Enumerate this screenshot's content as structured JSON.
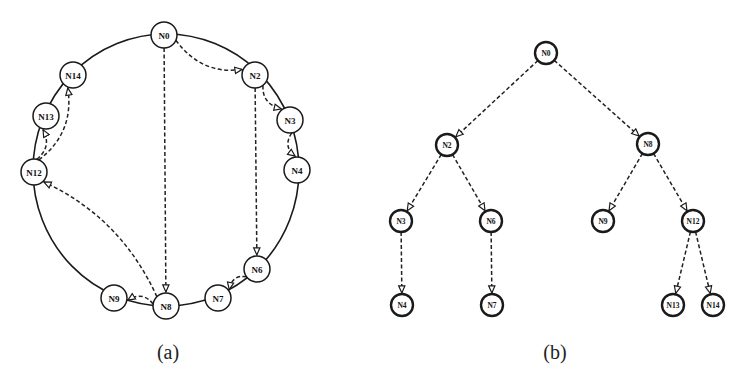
{
  "figure_a": {
    "caption": "(a)",
    "ring": {
      "cx": 166,
      "cy": 170,
      "rx": 133,
      "ry": 136
    },
    "node_radius": 13,
    "nodes": [
      {
        "id": "N0",
        "label": "N0",
        "x": 164,
        "y": 35
      },
      {
        "id": "N2",
        "label": "N2",
        "x": 255,
        "y": 75
      },
      {
        "id": "N3",
        "label": "N3",
        "x": 290,
        "y": 120
      },
      {
        "id": "N4",
        "label": "N4",
        "x": 297,
        "y": 170
      },
      {
        "id": "N6",
        "label": "N6",
        "x": 257,
        "y": 269
      },
      {
        "id": "N7",
        "label": "N7",
        "x": 218,
        "y": 298
      },
      {
        "id": "N8",
        "label": "N8",
        "x": 166,
        "y": 306
      },
      {
        "id": "N9",
        "label": "N9",
        "x": 114,
        "y": 298
      },
      {
        "id": "N12",
        "label": "N12",
        "x": 34,
        "y": 172
      },
      {
        "id": "N13",
        "label": "N13",
        "x": 46,
        "y": 116
      },
      {
        "id": "N14",
        "label": "N14",
        "x": 73,
        "y": 75
      }
    ],
    "edges": [
      {
        "from": "N0",
        "to": "N2"
      },
      {
        "from": "N0",
        "to": "N8"
      },
      {
        "from": "N2",
        "to": "N3"
      },
      {
        "from": "N2",
        "to": "N6"
      },
      {
        "from": "N3",
        "to": "N4"
      },
      {
        "from": "N6",
        "to": "N7"
      },
      {
        "from": "N8",
        "to": "N9"
      },
      {
        "from": "N8",
        "to": "N12"
      },
      {
        "from": "N12",
        "to": "N13"
      },
      {
        "from": "N12",
        "to": "N14"
      }
    ]
  },
  "figure_b": {
    "caption": "(b)",
    "node_radius": 11,
    "nodes": [
      {
        "id": "N0",
        "label": "N0",
        "x": 546,
        "y": 53
      },
      {
        "id": "N2",
        "label": "N2",
        "x": 447,
        "y": 145
      },
      {
        "id": "N8",
        "label": "N8",
        "x": 648,
        "y": 144
      },
      {
        "id": "N3",
        "label": "N3",
        "x": 401,
        "y": 221
      },
      {
        "id": "N6",
        "label": "N6",
        "x": 491,
        "y": 221
      },
      {
        "id": "N9",
        "label": "N9",
        "x": 603,
        "y": 221
      },
      {
        "id": "N12",
        "label": "N12",
        "x": 693,
        "y": 221
      },
      {
        "id": "N4",
        "label": "N4",
        "x": 402,
        "y": 305
      },
      {
        "id": "N7",
        "label": "N7",
        "x": 492,
        "y": 305
      },
      {
        "id": "N13",
        "label": "N13",
        "x": 673,
        "y": 305
      },
      {
        "id": "N14",
        "label": "N14",
        "x": 713,
        "y": 305
      }
    ],
    "edges": [
      {
        "from": "N0",
        "to": "N2"
      },
      {
        "from": "N0",
        "to": "N8"
      },
      {
        "from": "N2",
        "to": "N3"
      },
      {
        "from": "N2",
        "to": "N6"
      },
      {
        "from": "N3",
        "to": "N4"
      },
      {
        "from": "N6",
        "to": "N7"
      },
      {
        "from": "N8",
        "to": "N9"
      },
      {
        "from": "N8",
        "to": "N12"
      },
      {
        "from": "N12",
        "to": "N13"
      },
      {
        "from": "N12",
        "to": "N14"
      }
    ]
  },
  "captions": {
    "a": "(a)",
    "b": "(b)"
  }
}
